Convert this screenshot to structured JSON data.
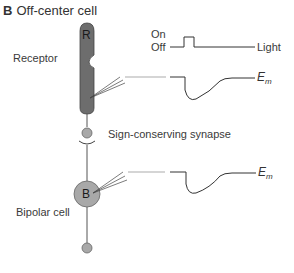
{
  "figure": {
    "panel_letter": "B",
    "title": "Off-center cell"
  },
  "labels": {
    "receptor": "Receptor",
    "receptor_glyph": "R",
    "bipolar": "Bipolar cell",
    "bipolar_glyph": "B",
    "synapse": "Sign-conserving synapse",
    "on": "On",
    "off": "Off",
    "light": "Light",
    "em_main": "E",
    "em_sub": "m"
  },
  "colors": {
    "receptor_fill": "#6d6d6d",
    "bipolar_fill": "#a8a8a8",
    "terminal_fill": "#a8a8a8",
    "line": "#4a4a4a"
  }
}
